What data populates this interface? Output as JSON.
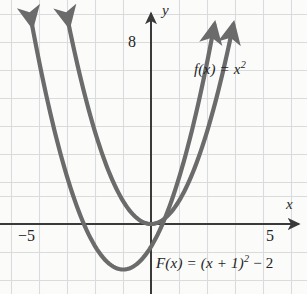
{
  "chart_data": {
    "type": "line",
    "title": "",
    "xlabel": "x",
    "ylabel": "y",
    "xlim": [
      -5.4,
      5.6
    ],
    "ylim": [
      -2.5,
      9.8
    ],
    "grid": true,
    "legend": "inline-annotations",
    "axis_arrows": true,
    "x_ticks": [
      -5,
      5
    ],
    "x_tick_labels": [
      "−5",
      "5"
    ],
    "y_ticks": [
      8
    ],
    "y_tick_labels": [
      "8"
    ],
    "series": [
      {
        "name": "f(x) = x²",
        "equation": "f(x) = x^2",
        "vertex": [
          0,
          0
        ],
        "color": "#6b6b6b",
        "label": "f(x) = x",
        "label_exponent": "2",
        "x": [
          -3.1,
          -2.5,
          -2.0,
          -1.5,
          -1.0,
          -0.5,
          0,
          0.5,
          1.0,
          1.5,
          2.0,
          2.5,
          3.1
        ],
        "y": [
          9.61,
          6.25,
          4.0,
          2.25,
          1.0,
          0.25,
          0,
          0.25,
          1.0,
          2.25,
          4.0,
          6.25,
          9.61
        ]
      },
      {
        "name": "F(x) = (x + 1)² − 2",
        "equation": "F(x) = (x + 1)^2 - 2",
        "vertex": [
          -1,
          -2
        ],
        "color": "#6b6b6b",
        "label_prefix": "F(x) = (x + 1)",
        "label_exponent": "2",
        "label_suffix": " − 2",
        "x": [
          -4.4,
          -4.0,
          -3.5,
          -3.0,
          -2.5,
          -2.0,
          -1.5,
          -1.0,
          -0.5,
          0,
          0.5,
          1.0,
          1.5,
          2.0,
          2.4
        ],
        "y": [
          9.56,
          7.0,
          4.25,
          2.0,
          0.25,
          -1.0,
          -1.75,
          -2.0,
          -1.75,
          -1.0,
          0.25,
          2.0,
          4.25,
          7.0,
          9.56
        ]
      }
    ],
    "colors": {
      "curve": "#6b6b6b",
      "axis": "#3a3a3a",
      "grid": "#d9dcdc",
      "background": "#fbfbfa",
      "text": "#242424"
    }
  },
  "axes": {
    "y_axis_label": "y",
    "x_axis_label": "x"
  },
  "ticks": {
    "y_8": "8",
    "x_neg5": "−5",
    "x_5": "5"
  },
  "annotations": {
    "f_label_base": "f(x) = x",
    "f_label_sup": "2",
    "F_label_pre": "F(x) = (x + 1)",
    "F_label_sup": "2",
    "F_label_post": " − 2"
  }
}
